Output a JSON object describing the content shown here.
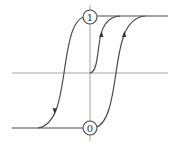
{
  "diagram": {
    "type": "hysteresis-loop",
    "markers": [
      {
        "id": "state-one",
        "label": "1",
        "position": "top"
      },
      {
        "id": "state-zero",
        "label": "0",
        "position": "bottom"
      }
    ],
    "colors": {
      "curve": "#4a4a4a",
      "axis": "#9a9a9a",
      "background": "#ffffff"
    },
    "arrows": [
      {
        "curve": "inner-magnetization",
        "direction": "up"
      },
      {
        "curve": "right-branch",
        "direction": "up"
      },
      {
        "curve": "left-branch",
        "direction": "down"
      }
    ]
  }
}
